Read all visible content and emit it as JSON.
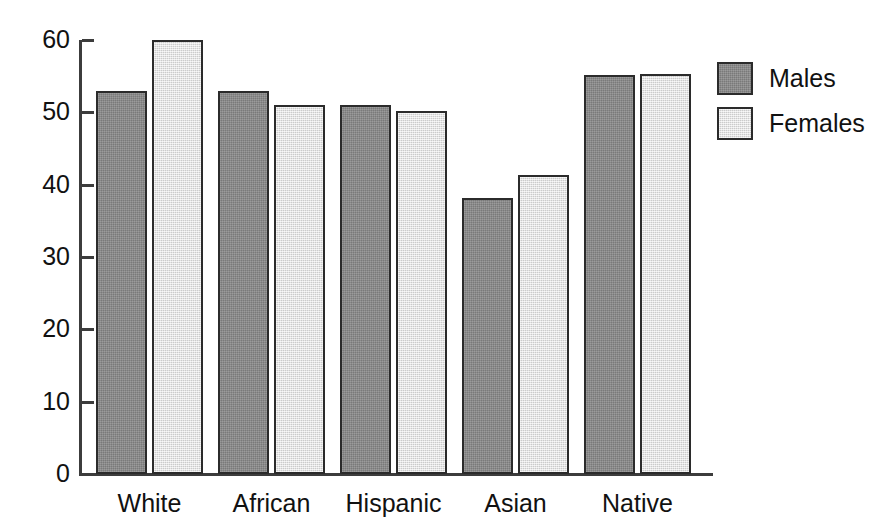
{
  "chart_data": {
    "type": "bar",
    "title": "",
    "subtitle": "",
    "xlabel": "",
    "ylabel": "",
    "categories": [
      "White",
      "African",
      "Hispanic",
      "Asian",
      "Native"
    ],
    "series": [
      {
        "name": "Males",
        "color": "#858585",
        "values": [
          53.0,
          53.0,
          51.0,
          38.2,
          55.2
        ]
      },
      {
        "name": "Females",
        "color": "#e2e2e2",
        "values": [
          60.0,
          51.0,
          50.2,
          41.3,
          55.3
        ]
      }
    ],
    "ylim": [
      0,
      60
    ],
    "yticks": [
      0,
      10,
      20,
      30,
      40,
      50,
      60
    ],
    "ytick_labels": [
      "0",
      "10",
      "20",
      "30",
      "40",
      "50",
      "60"
    ],
    "grid": false,
    "legend_position": "right",
    "legend": [
      "Males",
      "Females"
    ],
    "axis_color": "#3c3c3c",
    "bar_edge_color": "#2b2b2b"
  },
  "legend": {
    "entries": [
      {
        "label": "Males"
      },
      {
        "label": "Females"
      }
    ]
  }
}
